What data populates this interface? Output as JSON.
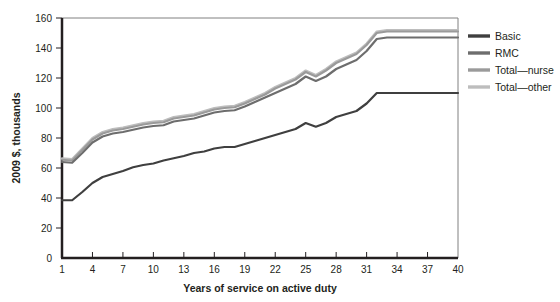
{
  "chart_data": {
    "type": "line",
    "title": "",
    "xlabel": "Years of service on active duty",
    "ylabel": "2009 $, thousands",
    "xlim": [
      1,
      40
    ],
    "ylim": [
      0,
      160
    ],
    "ytick_step": 20,
    "grid": false,
    "legend_position": "right",
    "xticks": [
      1,
      4,
      7,
      10,
      13,
      16,
      19,
      22,
      25,
      28,
      31,
      34,
      37,
      40
    ],
    "yticks": [
      0,
      20,
      40,
      60,
      80,
      100,
      120,
      140,
      160
    ],
    "x": [
      1,
      2,
      3,
      4,
      5,
      6,
      7,
      8,
      9,
      10,
      11,
      12,
      13,
      14,
      15,
      16,
      17,
      18,
      19,
      20,
      21,
      22,
      23,
      24,
      25,
      26,
      27,
      28,
      29,
      30,
      31,
      32,
      33,
      34,
      35,
      36,
      37,
      38,
      39,
      40
    ],
    "series": [
      {
        "name": "Basic",
        "color": "#3f3f3f",
        "values": [
          38.5,
          38.5,
          44,
          50,
          54,
          56,
          58,
          60.5,
          62,
          63,
          65,
          66.5,
          68,
          70,
          71,
          73,
          74,
          74,
          76,
          78,
          80,
          82,
          84,
          86,
          90,
          87.5,
          90,
          94,
          96,
          98,
          103,
          110,
          110,
          110,
          110,
          110,
          110,
          110,
          110,
          110
        ]
      },
      {
        "name": "RMC",
        "color": "#6d6d6d",
        "values": [
          64,
          63.5,
          70,
          77,
          81,
          83,
          84,
          85.5,
          87,
          88,
          88.5,
          91,
          92,
          93,
          95,
          97,
          98,
          98.5,
          101,
          104,
          107,
          110,
          113,
          116,
          121,
          118,
          121,
          126,
          129,
          132,
          138,
          146,
          147,
          147,
          147,
          147,
          147,
          147,
          147,
          147
        ]
      },
      {
        "name": "Total—nurse",
        "color": "#9a9a9a",
        "values": [
          65.5,
          65,
          72,
          79,
          83,
          85,
          86,
          87.5,
          89,
          90,
          90.5,
          93,
          94,
          95,
          97,
          99,
          100,
          100.5,
          103,
          106,
          109,
          113,
          116,
          119,
          124,
          121,
          125,
          130,
          133,
          136,
          142,
          150,
          151,
          151,
          151,
          151,
          151,
          151,
          151,
          151
        ]
      },
      {
        "name": "Total—other",
        "color": "#bdbdbd",
        "values": [
          66.5,
          66,
          73,
          80,
          84,
          86,
          87,
          88.5,
          90,
          91,
          91.5,
          94,
          95,
          96,
          98,
          100,
          101,
          101.5,
          104,
          107,
          110,
          114,
          117,
          120,
          125,
          122,
          126,
          131,
          134,
          137,
          143,
          151,
          152,
          152,
          152,
          152,
          152,
          152,
          152,
          152
        ]
      }
    ]
  },
  "legend": {
    "items": [
      {
        "label": "Basic",
        "color": "#3f3f3f"
      },
      {
        "label": "RMC",
        "color": "#6d6d6d"
      },
      {
        "label": "Total—nurse",
        "color": "#9a9a9a"
      },
      {
        "label": "Total—other",
        "color": "#bdbdbd"
      }
    ]
  },
  "axes": {
    "x_title": "Years of service on active duty",
    "y_title": "2009 $, thousands"
  }
}
